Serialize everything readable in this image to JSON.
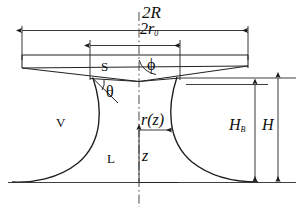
{
  "figure": {
    "kind": "capillary-bridge-meniscus-schematic",
    "labels": {
      "outer_diameter": "2R",
      "inner_diameter_main": "2r",
      "inner_diameter_sub": "0",
      "solid_region": "S",
      "phi_angle": "ϕ",
      "theta_angle": "θ",
      "vapor_region": "V",
      "liquid_region": "L",
      "radius_function": "r(z)",
      "axial_coordinate": "z",
      "bridge_height_main": "H",
      "bridge_height_sub": "B",
      "total_height": "H"
    },
    "colors": {
      "ink": "#111111",
      "line": "#2a2a2a",
      "background": "#ffffff"
    }
  }
}
